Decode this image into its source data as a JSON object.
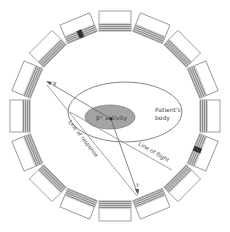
{
  "diagram": {
    "type": "PET detector ring schematic",
    "ring": {
      "center": [
        115,
        116
      ],
      "radius": 95,
      "detector_count": 16,
      "highlighted_detectors": [
        {
          "position": "upper-left",
          "angle_deg": 155
        },
        {
          "position": "bottom",
          "angle_deg": 290
        }
      ]
    },
    "labels": {
      "patients_body_line1": "Patient's",
      "patients_body_line2": "body",
      "activity": "β⁺ activity",
      "gamma_top": "γ",
      "gamma_bottom": "γ",
      "line_of_response": "Line of response",
      "line_of_flight": "Line of flight"
    },
    "colors": {
      "outline": "#888888",
      "hatch": "#9a9a9a",
      "highlight": "#333333",
      "activity_fill": "#9e9e9e",
      "line": "#777777",
      "text": "#444444"
    }
  }
}
